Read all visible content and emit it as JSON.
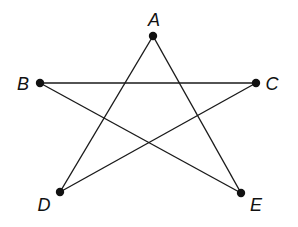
{
  "figure": {
    "type": "pentagram",
    "stroke_color": "#1a1a1a",
    "point_color": "#111111",
    "points": [
      {
        "id": "A",
        "label": "A",
        "x": 153,
        "y": 36,
        "lx": 154,
        "ly": 26
      },
      {
        "id": "B",
        "label": "B",
        "x": 40,
        "y": 83,
        "lx": 23,
        "ly": 90
      },
      {
        "id": "C",
        "label": "C",
        "x": 256,
        "y": 83,
        "lx": 272,
        "ly": 90
      },
      {
        "id": "D",
        "label": "D",
        "x": 60,
        "y": 192,
        "lx": 44,
        "ly": 211
      },
      {
        "id": "E",
        "label": "E",
        "x": 241,
        "y": 193,
        "lx": 256,
        "ly": 211
      }
    ],
    "segments": [
      {
        "from": "A",
        "to": "D"
      },
      {
        "from": "A",
        "to": "E"
      },
      {
        "from": "B",
        "to": "C"
      },
      {
        "from": "B",
        "to": "E"
      },
      {
        "from": "C",
        "to": "D"
      }
    ]
  }
}
